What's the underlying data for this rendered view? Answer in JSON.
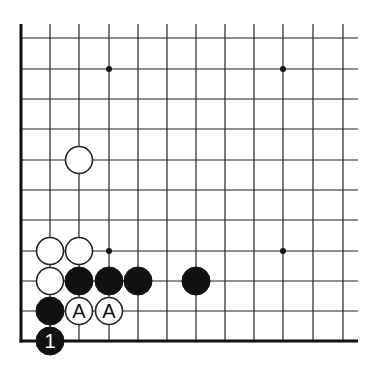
{
  "diagram": {
    "type": "go-board-fragment",
    "corner": "bottom-left",
    "grid": {
      "columns_x": [
        21,
        50,
        79,
        109,
        138,
        167,
        196,
        225,
        254,
        283,
        313,
        343
      ],
      "rows_y": [
        38,
        69,
        99,
        129,
        160,
        190,
        220,
        251,
        281,
        311,
        341
      ],
      "top_extend_y": 24,
      "right_extend_x": 358,
      "line_color": "#222222",
      "edge_color": "#111111"
    },
    "star_points": [
      {
        "col": 3,
        "row": 1
      },
      {
        "col": 9,
        "row": 1
      },
      {
        "col": 3,
        "row": 7
      },
      {
        "col": 9,
        "row": 7
      }
    ],
    "stones": [
      {
        "color": "white",
        "col": 2,
        "row": 4,
        "label": ""
      },
      {
        "color": "white",
        "col": 1,
        "row": 7,
        "label": ""
      },
      {
        "color": "white",
        "col": 2,
        "row": 7,
        "label": ""
      },
      {
        "color": "white",
        "col": 1,
        "row": 8,
        "label": ""
      },
      {
        "color": "black",
        "col": 2,
        "row": 8,
        "label": ""
      },
      {
        "color": "black",
        "col": 3,
        "row": 8,
        "label": ""
      },
      {
        "color": "black",
        "col": 4,
        "row": 8,
        "label": ""
      },
      {
        "color": "black",
        "col": 6,
        "row": 8,
        "label": ""
      },
      {
        "color": "black",
        "col": 1,
        "row": 9,
        "label": ""
      },
      {
        "color": "white",
        "col": 2,
        "row": 9,
        "label": "A"
      },
      {
        "color": "white",
        "col": 3,
        "row": 9,
        "label": "A"
      },
      {
        "color": "black",
        "col": 1,
        "row": 10,
        "label": "1"
      }
    ],
    "stone_radius": 14,
    "colors": {
      "black_stone": "#111111",
      "white_stone": "#ffffff",
      "stone_outline": "#222222",
      "label_on_black": "#ffffff",
      "label_on_white": "#111111"
    }
  }
}
